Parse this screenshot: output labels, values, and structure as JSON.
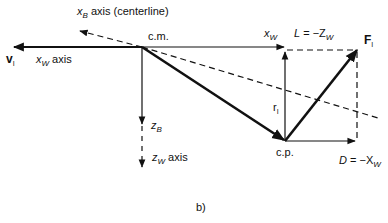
{
  "figure": {
    "caption": "b)",
    "points": {
      "cm": {
        "label": "c.m.",
        "x": 142,
        "y": 47
      },
      "cp": {
        "label": "c.p.",
        "x": 285,
        "y": 141
      }
    },
    "labels": {
      "xB_axis": {
        "var": "x",
        "sub": "B",
        "text": " axis (centerline)"
      },
      "vI": {
        "var": "v",
        "sub": "I"
      },
      "xW_axis": {
        "var": "x",
        "sub": "W",
        "text": " axis"
      },
      "xW": {
        "var": "x",
        "sub": "W"
      },
      "L": {
        "lhs": "L",
        "rhs": " = −Z",
        "sub": "W"
      },
      "FI": {
        "var": "F",
        "sub": "I"
      },
      "rI": {
        "var": "r",
        "sub": "I"
      },
      "zB": {
        "var": "z",
        "sub": "B"
      },
      "zW_axis": {
        "var": "z",
        "sub": "W",
        "text": " axis"
      },
      "D": {
        "lhs": "D",
        "rhs": " = −X",
        "sub": "W"
      }
    }
  }
}
